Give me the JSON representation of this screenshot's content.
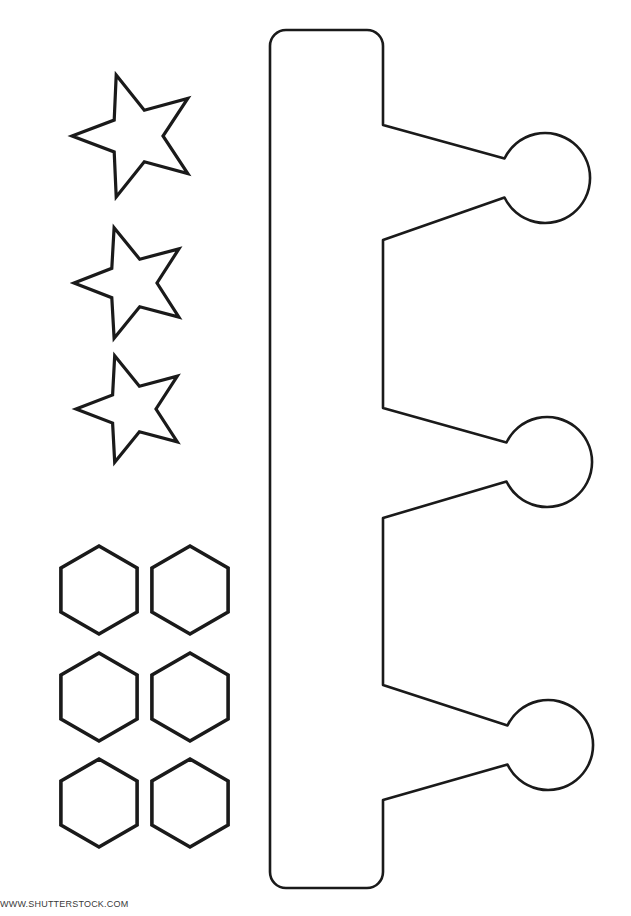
{
  "page": {
    "background_color": "#ffffff",
    "stroke_color": "#1a1a1a",
    "width": 631,
    "height": 916
  },
  "caption": {
    "text": "WWW.SHUTTERSTOCK.COM"
  },
  "shapes": {
    "stars": {
      "label": "Star cut-outs",
      "count": 3,
      "items": [
        {
          "name": "star-1",
          "cx": 136,
          "cy": 136,
          "outer_r": 64,
          "inner_r": 27,
          "rotation": -18
        },
        {
          "name": "star-2",
          "cx": 132,
          "cy": 283,
          "outer_r": 58,
          "inner_r": 25,
          "rotation": -18
        },
        {
          "name": "star-3",
          "cx": 132,
          "cy": 409,
          "outer_r": 56,
          "inner_r": 24,
          "rotation": -18
        }
      ]
    },
    "hexagons": {
      "label": "Hexagon cut-outs",
      "count": 6,
      "columns": 2,
      "rows": 3,
      "items": [
        {
          "name": "hexagon-1",
          "cx": 99,
          "cy": 590,
          "r": 44
        },
        {
          "name": "hexagon-2",
          "cx": 190,
          "cy": 590,
          "r": 44
        },
        {
          "name": "hexagon-3",
          "cx": 99,
          "cy": 697,
          "r": 44
        },
        {
          "name": "hexagon-4",
          "cx": 190,
          "cy": 697,
          "r": 44
        },
        {
          "name": "hexagon-5",
          "cx": 99,
          "cy": 803,
          "r": 44
        },
        {
          "name": "hexagon-6",
          "cx": 190,
          "cy": 803,
          "r": 44
        }
      ]
    },
    "crown_band": {
      "label": "Crown band with three circle ornaments",
      "band_left": 270,
      "band_right": 383,
      "band_top": 30,
      "band_bottom": 888,
      "corner_radius": 16,
      "circles": [
        {
          "name": "ornament-circle-1",
          "cx": 545,
          "cy": 178,
          "r": 45
        },
        {
          "name": "ornament-circle-2",
          "cx": 547,
          "cy": 462,
          "r": 45
        },
        {
          "name": "ornament-circle-3",
          "cx": 548,
          "cy": 745,
          "r": 45
        }
      ],
      "arm_junctions": [
        {
          "top": 125,
          "bottom": 240
        },
        {
          "top": 408,
          "bottom": 518
        },
        {
          "top": 685,
          "bottom": 800
        }
      ]
    }
  }
}
